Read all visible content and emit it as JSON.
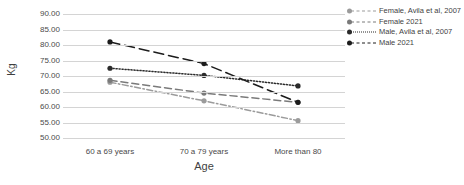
{
  "chart_data": {
    "type": "line",
    "title": "",
    "xlabel": "Age",
    "ylabel": "Kg",
    "categories": [
      "60 a 69 years",
      "70 a 79 years",
      "More than 80"
    ],
    "ylim": [
      50,
      90
    ],
    "ytick_step": 5,
    "ytick_labels": [
      "90.00",
      "85.00",
      "80.00",
      "75.00",
      "70.00",
      "65.00",
      "60.00",
      "55.00",
      "50.00"
    ],
    "grid": true,
    "legend_position": "right",
    "series": [
      {
        "name": "Female, Avila et al, 2007",
        "values": [
          68.0,
          62.0,
          55.6
        ],
        "color": "#9b9b9b",
        "style": "dashdot",
        "marker": "circle"
      },
      {
        "name": "Female 2021",
        "values": [
          68.6,
          64.5,
          61.5
        ],
        "color": "#7a7a7a",
        "style": "dashed",
        "marker": "circle"
      },
      {
        "name": "Male, Avila et al, 2007",
        "values": [
          72.5,
          70.2,
          66.8
        ],
        "color": "#2b2b2b",
        "style": "dotted",
        "marker": "circle"
      },
      {
        "name": "Male 2021",
        "values": [
          81.0,
          74.0,
          61.5
        ],
        "color": "#1c1c1c",
        "style": "dashed-long",
        "marker": "circle"
      }
    ]
  },
  "axis": {
    "y_title": "Kg",
    "x_title": "Age"
  }
}
